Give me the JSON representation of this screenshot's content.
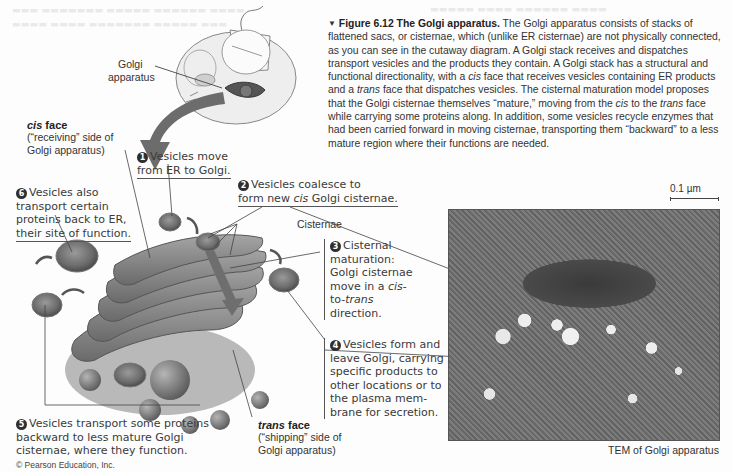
{
  "caption": {
    "figure_label": "Figure 6.12",
    "figure_title": "The Golgi apparatus.",
    "body_segments": [
      {
        "text": " The Golgi apparatus consists of stacks of flattened sacs, or cisternae, which (unlike ER cisternae) are not physically connected, as you can see in the cutaway diagram. A Golgi stack receives and dispatches transport vesicles and the products they contain. A Golgi stack has a structural and functional directionality, with a ",
        "italic": false
      },
      {
        "text": "cis",
        "italic": true
      },
      {
        "text": " face that receives vesicles containing ER products and a ",
        "italic": false
      },
      {
        "text": "trans",
        "italic": true
      },
      {
        "text": " face that dispatches vesicles. The cisternal maturation model proposes that the Golgi cisternae themselves “mature,” moving from the ",
        "italic": false
      },
      {
        "text": "cis",
        "italic": true
      },
      {
        "text": " to the ",
        "italic": false
      },
      {
        "text": "trans",
        "italic": true
      },
      {
        "text": " face while carrying some proteins along. In addition, some vesicles recycle enzymes that had been carried forward in moving cisternae, transporting them “backward” to a less mature region where their functions are needed.",
        "italic": false
      }
    ]
  },
  "cell_inset": {
    "label_line1": "Golgi",
    "label_line2": "apparatus"
  },
  "cis_face": {
    "title_italic": "cis",
    "title_rest": " face",
    "sub_line1": "(“receiving” side of",
    "sub_line2": "Golgi apparatus)"
  },
  "trans_face": {
    "title_italic": "trans",
    "title_rest": " face",
    "sub_line1": "(“shipping” side of",
    "sub_line2": "Golgi apparatus)"
  },
  "cisternae_label": "Cisternae",
  "steps": [
    {
      "num": "1",
      "lines": [
        "Vesicles move",
        "from ER to Golgi."
      ]
    },
    {
      "num": "2",
      "lines": [
        "Vesicles coalesce to",
        "form new ",
        "cis",
        " Golgi cisternae."
      ]
    },
    {
      "num": "3",
      "lines": [
        "Cisternal",
        "maturation:",
        "Golgi cisternae",
        "move in a ",
        "cis",
        "-",
        "to-",
        "trans",
        "direction."
      ]
    },
    {
      "num": "4",
      "lines": [
        "Vesicles form and",
        "leave Golgi, carrying",
        "specific products to",
        "other locations or to",
        "the plasma mem-",
        "brane for secretion."
      ]
    },
    {
      "num": "5",
      "lines": [
        "Vesicles transport some proteins",
        "backward to less mature Golgi",
        "cisternae, where they function."
      ]
    },
    {
      "num": "6",
      "lines": [
        "Vesicles also",
        "transport certain",
        "proteins back to ER,",
        "their site of function."
      ]
    }
  ],
  "micrograph": {
    "scale_bar": "0.1 µm",
    "caption": "TEM of Golgi apparatus"
  },
  "copyright": "© Pearson Education, Inc.",
  "colors": {
    "badge": "#2f2f2f",
    "arrow": "#6a6a6a",
    "cisterna": "#8a8a8a",
    "lumen": "#5e5e5e"
  }
}
